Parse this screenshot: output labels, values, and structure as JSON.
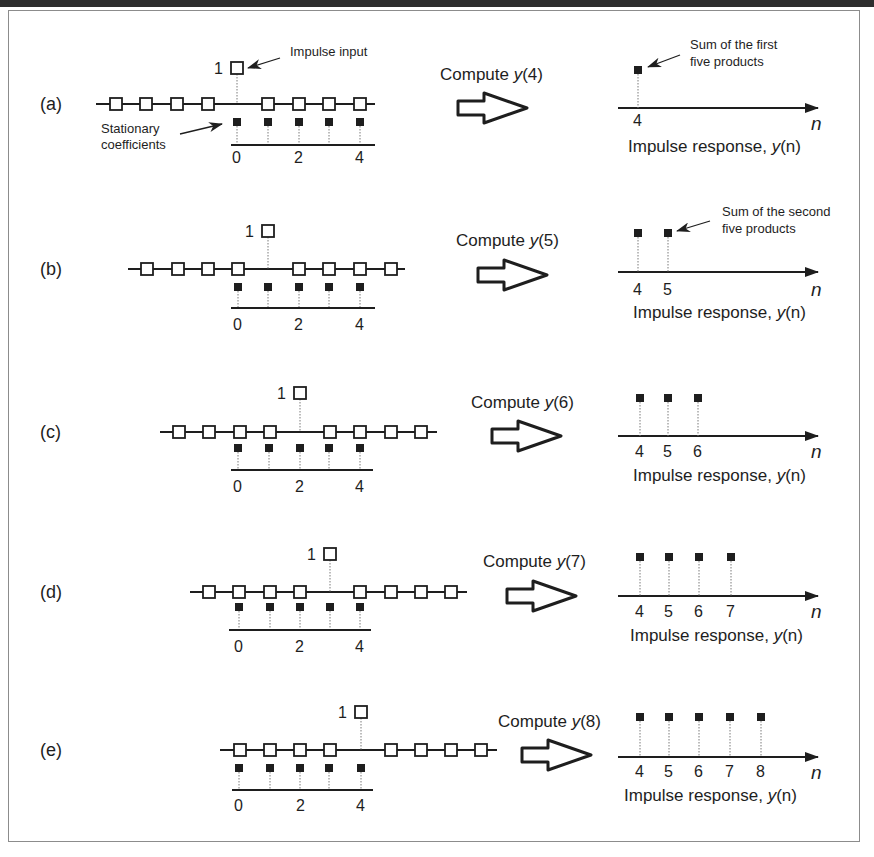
{
  "figure": {
    "annotations": {
      "impulse_input": "Impulse input",
      "stationary_coefficients_line1": "Stationary",
      "stationary_coefficients_line2": "coefficients",
      "sum_first_line1": "Sum of the first",
      "sum_first_line2": "five products",
      "sum_second_line1": "Sum of the second",
      "sum_second_line2": "five products"
    },
    "impulse_value": "1",
    "coef_tick_labels": [
      "0",
      "2",
      "4"
    ],
    "axis_var": "n",
    "response_title_prefix": "Impulse response, ",
    "response_title_y": "y",
    "response_title_arg": "(n)",
    "rows": [
      {
        "label": "(a)",
        "compute_prefix": "Compute ",
        "compute_y": "y",
        "compute_arg": "(4)",
        "outputs": [
          "4"
        ]
      },
      {
        "label": "(b)",
        "compute_prefix": "Compute ",
        "compute_y": "y",
        "compute_arg": "(5)",
        "outputs": [
          "4",
          "5"
        ]
      },
      {
        "label": "(c)",
        "compute_prefix": "Compute ",
        "compute_y": "y",
        "compute_arg": "(6)",
        "outputs": [
          "4",
          "5",
          "6"
        ]
      },
      {
        "label": "(d)",
        "compute_prefix": "Compute ",
        "compute_y": "y",
        "compute_arg": "(7)",
        "outputs": [
          "4",
          "5",
          "6",
          "7"
        ]
      },
      {
        "label": "(e)",
        "compute_prefix": "Compute ",
        "compute_y": "y",
        "compute_arg": "(8)",
        "outputs": [
          "4",
          "5",
          "6",
          "7",
          "8"
        ]
      }
    ]
  },
  "colors": {
    "ink": "#1e1e1e",
    "frame": "#8c8c8c",
    "topbar": "#2e2e2e",
    "dotted": "#7a7a7a"
  }
}
